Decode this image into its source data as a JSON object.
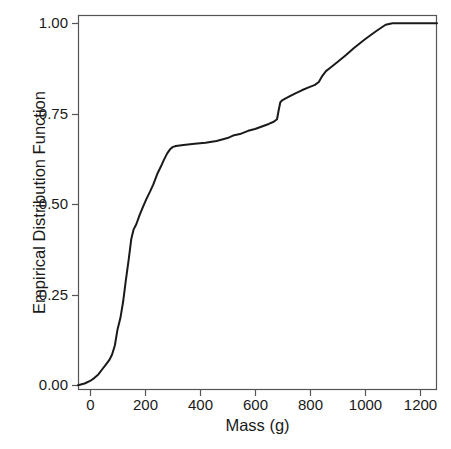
{
  "chart_data": {
    "type": "line",
    "title": "",
    "xlabel": "Mass (g)",
    "ylabel": "Empirical Distribution Function",
    "xlim": [
      -44,
      1262
    ],
    "ylim": [
      -0.013,
      1.023
    ],
    "xticks": [
      0,
      200,
      400,
      600,
      800,
      1000,
      1200
    ],
    "xticklabels": [
      "0",
      "200",
      "400",
      "600",
      "800",
      "1000",
      "1200"
    ],
    "yticks": [
      0.0,
      0.25,
      0.5,
      0.75,
      1.0
    ],
    "yticklabels": [
      "0.00",
      "0.25",
      "0.50",
      "0.75",
      "1.00"
    ],
    "grid": false,
    "legend": null,
    "line_color": "#1a1a1a",
    "line_width": 2.0,
    "frame_color": "#555555",
    "background": "#ffffff",
    "series": [
      {
        "name": "Empirical Distribution Function",
        "x": [
          -44,
          -20,
          0,
          15,
          30,
          45,
          58,
          70,
          80,
          90,
          100,
          110,
          120,
          130,
          140,
          150,
          158,
          168,
          180,
          192,
          205,
          218,
          230,
          245,
          258,
          268,
          280,
          292,
          300,
          312,
          340,
          380,
          420,
          460,
          500,
          520,
          545,
          575,
          600,
          625,
          650,
          668,
          680,
          686,
          692,
          700,
          720,
          745,
          770,
          795,
          818,
          832,
          845,
          858,
          875,
          900,
          930,
          960,
          1000,
          1040,
          1075,
          1100,
          1262
        ],
        "y": [
          0.0,
          0.005,
          0.012,
          0.02,
          0.03,
          0.045,
          0.058,
          0.07,
          0.085,
          0.11,
          0.155,
          0.185,
          0.23,
          0.29,
          0.345,
          0.405,
          0.43,
          0.445,
          0.47,
          0.492,
          0.515,
          0.535,
          0.555,
          0.585,
          0.605,
          0.622,
          0.64,
          0.653,
          0.658,
          0.661,
          0.664,
          0.667,
          0.67,
          0.675,
          0.683,
          0.69,
          0.694,
          0.703,
          0.708,
          0.715,
          0.722,
          0.728,
          0.735,
          0.76,
          0.782,
          0.788,
          0.796,
          0.806,
          0.815,
          0.823,
          0.83,
          0.838,
          0.855,
          0.868,
          0.878,
          0.893,
          0.912,
          0.932,
          0.956,
          0.978,
          0.996,
          1.0,
          1.0
        ]
      }
    ]
  },
  "axes": {
    "x_title": "Mass (g)",
    "y_title": "Empirical Distribution Function"
  }
}
